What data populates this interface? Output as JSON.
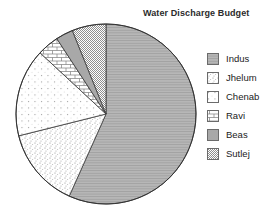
{
  "title": "Water Discharge Budget",
  "colors": {
    "background": "#ffffff",
    "text": "#2b2b2b",
    "slice_border": "#3a3a3a",
    "outer_circle": "#333333",
    "swatch_border": "#6b6b6b",
    "indus_gray": "#b7b7b7",
    "beas_gray": "#a8a8a8",
    "pattern_gray": "#8f8f8f"
  },
  "legend": {
    "position": "right",
    "items": [
      "Indus",
      "Jhelum",
      "Chenab",
      "Ravi",
      "Beas",
      "Sutlej"
    ]
  },
  "chart_data": {
    "type": "pie",
    "title": "Water Discharge Budget",
    "categories": [
      "Indus",
      "Jhelum",
      "Chenab",
      "Ravi",
      "Beas",
      "Sutlej"
    ],
    "values": [
      56.7,
      14.4,
      15.8,
      3.9,
      3.1,
      6.1
    ],
    "value_note": "percent of pie, estimated from slice angles (no numeric labels shown in figure)",
    "start_angle_deg": 0,
    "direction": "clockwise",
    "legend_position": "right",
    "patterns": [
      "gray-horizontal-lines",
      "dense-stipple-dots",
      "sparse-dots",
      "brick",
      "solid-gray",
      "checker-crosshatch"
    ]
  }
}
